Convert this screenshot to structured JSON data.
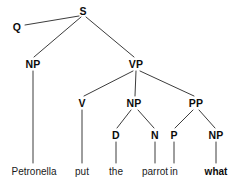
{
  "figure": {
    "kind": "syntax-tree",
    "sentence": "Petronella put the parrot in what",
    "background_color": "#ffffff",
    "branch_color": "#3c3c3c",
    "node_text_color": "#0b0b0b",
    "terminal_text_color": "#1a1a1a"
  },
  "nodes": [
    {
      "id": "S",
      "label": "S",
      "x": 83,
      "y": 11
    },
    {
      "id": "Q",
      "label": "Q",
      "x": 17,
      "y": 27
    },
    {
      "id": "NP1",
      "label": "NP",
      "x": 33,
      "y": 64
    },
    {
      "id": "VP",
      "label": "VP",
      "x": 136,
      "y": 64
    },
    {
      "id": "V",
      "label": "V",
      "x": 82,
      "y": 103
    },
    {
      "id": "NP2",
      "label": "NP",
      "x": 134,
      "y": 103
    },
    {
      "id": "PP",
      "label": "PP",
      "x": 196,
      "y": 103
    },
    {
      "id": "D",
      "label": "D",
      "x": 116,
      "y": 135
    },
    {
      "id": "N",
      "label": "N",
      "x": 155,
      "y": 135
    },
    {
      "id": "P",
      "label": "P",
      "x": 174,
      "y": 135
    },
    {
      "id": "NP3",
      "label": "NP",
      "x": 216,
      "y": 135
    }
  ],
  "terminals": [
    {
      "id": "w-petronella",
      "label": "Petronella",
      "x": 34,
      "y": 172,
      "bold": false
    },
    {
      "id": "w-put",
      "label": "put",
      "x": 82,
      "y": 172,
      "bold": false
    },
    {
      "id": "w-the",
      "label": "the",
      "x": 116,
      "y": 172,
      "bold": false
    },
    {
      "id": "w-parrot",
      "label": "parrot",
      "x": 155,
      "y": 172,
      "bold": false
    },
    {
      "id": "w-in",
      "label": "in",
      "x": 174,
      "y": 172,
      "bold": false
    },
    {
      "id": "w-what",
      "label": "what",
      "x": 216,
      "y": 172,
      "bold": true
    }
  ],
  "branches": [
    {
      "from": "Q",
      "to": "S",
      "x1": 25,
      "y1": 25,
      "x2": 79,
      "y2": 16
    },
    {
      "from": "S",
      "to": "NP1",
      "x1": 81,
      "y1": 17,
      "x2": 34,
      "y2": 57
    },
    {
      "from": "S",
      "to": "VP",
      "x1": 86,
      "y1": 17,
      "x2": 134,
      "y2": 57
    },
    {
      "from": "NP1",
      "to": "w-petronella",
      "x1": 33,
      "y1": 71,
      "x2": 33,
      "y2": 163
    },
    {
      "from": "VP",
      "to": "V",
      "x1": 133,
      "y1": 71,
      "x2": 84,
      "y2": 96
    },
    {
      "from": "VP",
      "to": "NP2",
      "x1": 136,
      "y1": 71,
      "x2": 135,
      "y2": 96
    },
    {
      "from": "VP",
      "to": "PP",
      "x1": 140,
      "y1": 71,
      "x2": 194,
      "y2": 96
    },
    {
      "from": "V",
      "to": "w-put",
      "x1": 82,
      "y1": 110,
      "x2": 82,
      "y2": 163
    },
    {
      "from": "NP2",
      "to": "D",
      "x1": 131,
      "y1": 110,
      "x2": 117,
      "y2": 128
    },
    {
      "from": "NP2",
      "to": "N",
      "x1": 138,
      "y1": 110,
      "x2": 154,
      "y2": 128
    },
    {
      "from": "PP",
      "to": "P",
      "x1": 193,
      "y1": 110,
      "x2": 175,
      "y2": 128
    },
    {
      "from": "PP",
      "to": "NP3",
      "x1": 199,
      "y1": 110,
      "x2": 215,
      "y2": 128
    },
    {
      "from": "D",
      "to": "w-the",
      "x1": 116,
      "y1": 142,
      "x2": 116,
      "y2": 163
    },
    {
      "from": "N",
      "to": "w-parrot",
      "x1": 155,
      "y1": 142,
      "x2": 155,
      "y2": 163
    },
    {
      "from": "P",
      "to": "w-in",
      "x1": 174,
      "y1": 142,
      "x2": 174,
      "y2": 163
    },
    {
      "from": "NP3",
      "to": "w-what",
      "x1": 216,
      "y1": 142,
      "x2": 216,
      "y2": 163
    }
  ]
}
